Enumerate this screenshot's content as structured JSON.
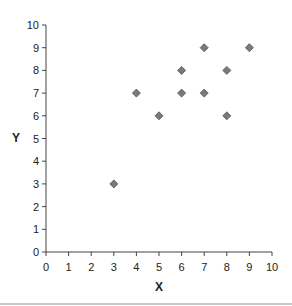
{
  "chart_data": {
    "type": "scatter",
    "title": "",
    "xlabel": "X",
    "ylabel": "Y",
    "xlim": [
      0,
      10
    ],
    "ylim": [
      0,
      10
    ],
    "xticks": [
      "0",
      "1",
      "2",
      "3",
      "4",
      "5",
      "6",
      "7",
      "8",
      "9",
      "10"
    ],
    "yticks": [
      "0",
      "1",
      "2",
      "3",
      "4",
      "5",
      "6",
      "7",
      "8",
      "9",
      "10"
    ],
    "grid": false,
    "legend": null,
    "series": [
      {
        "name": "",
        "marker": "diamond",
        "color": "#7a7a7a",
        "points": [
          {
            "x": 3,
            "y": 3
          },
          {
            "x": 4,
            "y": 7
          },
          {
            "x": 5,
            "y": 6
          },
          {
            "x": 6,
            "y": 7
          },
          {
            "x": 6,
            "y": 8
          },
          {
            "x": 7,
            "y": 7
          },
          {
            "x": 7,
            "y": 9
          },
          {
            "x": 8,
            "y": 6
          },
          {
            "x": 8,
            "y": 8
          },
          {
            "x": 9,
            "y": 9
          }
        ]
      }
    ]
  },
  "colors": {
    "axis": "#444444",
    "marker_fill": "#7a7a7a",
    "marker_stroke": "#505050"
  }
}
